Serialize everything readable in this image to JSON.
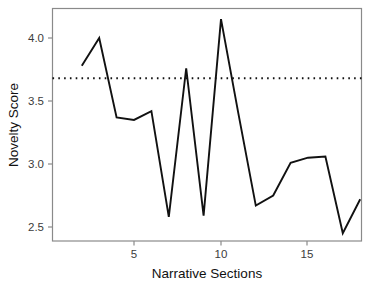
{
  "chart_data": {
    "type": "line",
    "title": "",
    "xlabel": "Narrative Sections",
    "ylabel": "Novelty Score",
    "x": [
      2,
      3,
      4,
      5,
      6,
      7,
      8,
      9,
      10,
      11,
      12,
      13,
      14,
      15,
      16,
      17,
      18
    ],
    "values": [
      3.78,
      4.0,
      3.37,
      3.35,
      3.42,
      2.58,
      3.76,
      2.59,
      4.15,
      3.4,
      2.67,
      2.75,
      3.01,
      3.05,
      3.06,
      2.45,
      2.72
    ],
    "series": [
      {
        "name": "Novelty Score",
        "values": [
          3.78,
          4.0,
          3.37,
          3.35,
          3.42,
          2.58,
          3.76,
          2.59,
          4.15,
          3.4,
          2.67,
          2.75,
          3.01,
          3.05,
          3.06,
          2.45,
          2.72
        ],
        "style": "solid",
        "color": "#111111"
      }
    ],
    "annotations": [
      {
        "name": "mean-reference-line",
        "type": "horizontal-line",
        "value": 3.68,
        "style": "dotted",
        "color": "#111111"
      }
    ],
    "xlim": [
      1.2,
      18.8
    ],
    "ylim": [
      2.35,
      4.25
    ],
    "xticks": [
      5,
      10,
      15
    ],
    "xtick_labels": [
      "5",
      "10",
      "15"
    ],
    "yticks": [
      2.5,
      3.0,
      3.5,
      4.0
    ],
    "ytick_labels": [
      "2.5",
      "3.0",
      "3.5",
      "4.0"
    ],
    "grid": false,
    "legend": "none",
    "panel_border": true,
    "background": "#ffffff"
  }
}
